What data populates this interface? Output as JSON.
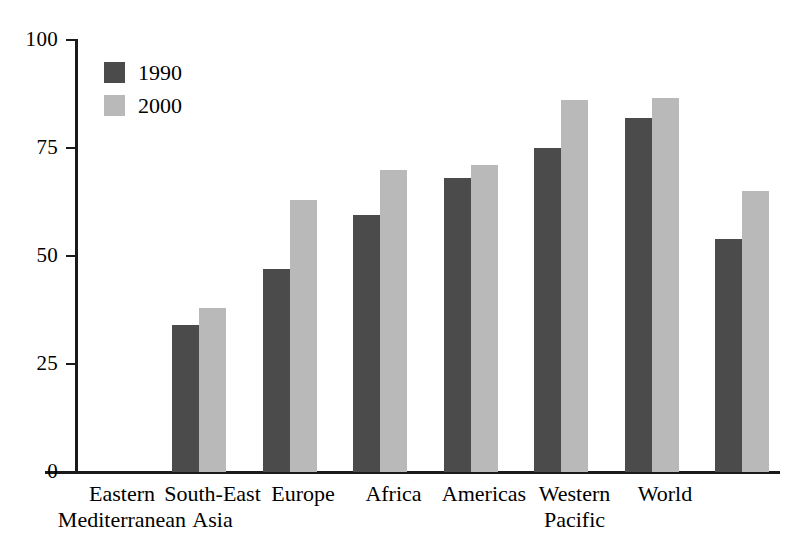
{
  "chart_data": {
    "type": "bar",
    "title": "",
    "subtitle": "",
    "xlabel": "",
    "ylabel": "",
    "ylim": [
      0,
      100
    ],
    "yticks": [
      "0",
      "25",
      "50",
      "75",
      "100"
    ],
    "ytick_values": [
      0,
      25,
      50,
      75,
      100
    ],
    "grid": false,
    "legend_position": "top-left",
    "categories": [
      "Eastern Mediterranean",
      "South-East Asia",
      "Europe",
      "Africa",
      "Americas",
      "Western Pacific",
      "World"
    ],
    "category_lines": [
      [
        "Eastern",
        "Mediterranean"
      ],
      [
        "South-East",
        "Asia"
      ],
      [
        "Europe",
        ""
      ],
      [
        "Africa",
        ""
      ],
      [
        "Americas",
        ""
      ],
      [
        "Western",
        "Pacific"
      ],
      [
        "World",
        ""
      ]
    ],
    "series": [
      {
        "name": "1990",
        "color": "#4b4b4b",
        "values": [
          34,
          47,
          59.5,
          68,
          75,
          82,
          54
        ]
      },
      {
        "name": "2000",
        "color": "#b9b9b9",
        "values": [
          38,
          63,
          70,
          71,
          86,
          86.5,
          65
        ]
      }
    ]
  },
  "legend": {
    "items": [
      {
        "label": "1990",
        "swatch": "legend-swatch-1990"
      },
      {
        "label": "2000",
        "swatch": "legend-swatch-2000"
      }
    ]
  },
  "axis": {
    "y_tick_labels": [
      "100",
      "75",
      "50",
      "25",
      "0"
    ]
  },
  "colors": {
    "series_1990": "#4b4b4b",
    "series_2000": "#b9b9b9",
    "axis": "#1a1a1a",
    "background": "#ffffff"
  }
}
